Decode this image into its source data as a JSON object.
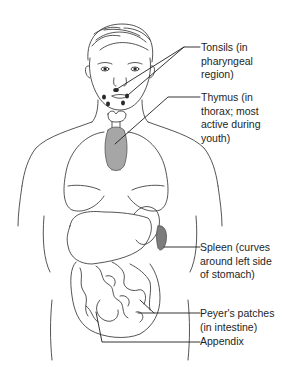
{
  "figure": {
    "colors": {
      "line": "#2a2a2a",
      "tissue": "#8a8a8a",
      "spleen": "#7c7c7c",
      "background": "#ffffff"
    }
  },
  "labels": {
    "tonsils": "Tonsils (in\npharyngeal\nregion)",
    "thymus": "Thymus (in\nthorax; most\nactive during\nyouth)",
    "spleen": "Spleen (curves\naround left side\nof stomach)",
    "peyers_patches": "Peyer's patches\n(in intestine)",
    "appendix": "Appendix"
  }
}
